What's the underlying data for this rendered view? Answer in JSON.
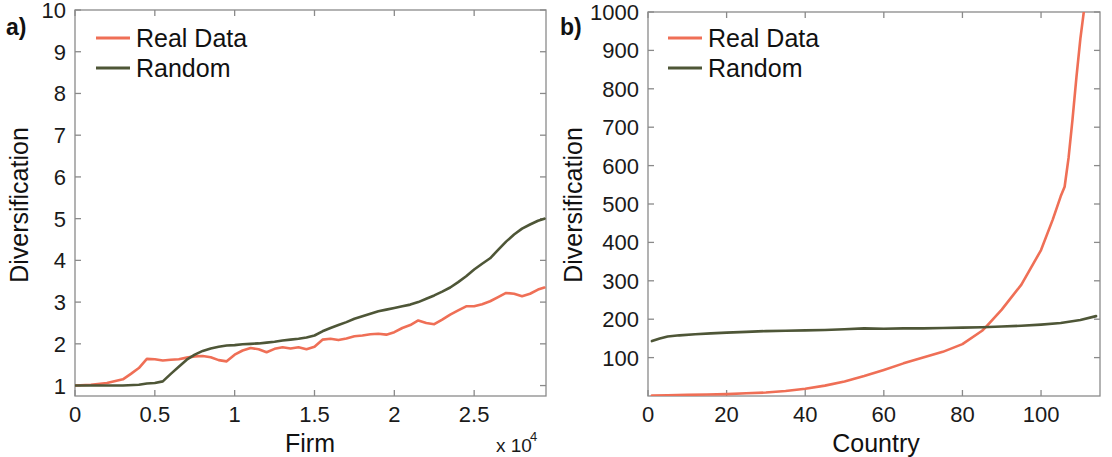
{
  "figure": {
    "background": "#ffffff",
    "colors": {
      "real_data": "#ef6f56",
      "random": "#4e5637",
      "axis": "#8a8a8a",
      "text": "#111111"
    }
  },
  "panels": [
    {
      "tag": "a)",
      "xlabel": "Firm",
      "ylabel": "Diversification",
      "x_exponent_prefix": "x 10",
      "x_exponent_power": "4",
      "legend": [
        {
          "label": "Real Data",
          "color": "#ef6f56"
        },
        {
          "label": "Random",
          "color": "#4e5637"
        }
      ],
      "xticks": [
        "0",
        "0.5",
        "1",
        "1.5",
        "2",
        "2.5"
      ],
      "yticks": [
        "1",
        "2",
        "3",
        "4",
        "5",
        "6",
        "7",
        "8",
        "9",
        "10"
      ]
    },
    {
      "tag": "b)",
      "xlabel": "Country",
      "ylabel": "Diversification",
      "legend": [
        {
          "label": "Real Data",
          "color": "#ef6f56"
        },
        {
          "label": "Random",
          "color": "#4e5637"
        }
      ],
      "xticks": [
        "0",
        "20",
        "40",
        "60",
        "80",
        "100"
      ],
      "yticks": [
        "100",
        "200",
        "300",
        "400",
        "500",
        "600",
        "700",
        "800",
        "900",
        "1000"
      ]
    }
  ],
  "chart_data": [
    {
      "type": "line",
      "panel": "a)",
      "title": "",
      "xlabel": "Firm",
      "ylabel": "Diversification",
      "x_scale_factor": 10000,
      "x_tick_values": [
        0,
        5000,
        10000,
        15000,
        20000,
        25000
      ],
      "y_tick_values": [
        1,
        2,
        3,
        4,
        5,
        6,
        7,
        8,
        9,
        10
      ],
      "xlim": [
        0,
        29500
      ],
      "ylim": [
        0.75,
        10
      ],
      "grid": false,
      "legend_position": "top-left",
      "series": [
        {
          "name": "Real Data",
          "color": "#ef6f56",
          "x": [
            0,
            1000,
            2000,
            3000,
            3500,
            4000,
            4500,
            5000,
            5500,
            6000,
            6500,
            7000,
            7500,
            8000,
            8500,
            9000,
            9500,
            10000,
            10500,
            11000,
            11500,
            12000,
            12500,
            13000,
            13500,
            14000,
            14500,
            15000,
            15500,
            16000,
            16500,
            17000,
            17500,
            18000,
            18500,
            19000,
            19500,
            20000,
            20500,
            21000,
            21500,
            22000,
            22500,
            23000,
            23500,
            24000,
            24500,
            25000,
            25500,
            26000,
            26500,
            27000,
            27500,
            28000,
            28500,
            29000,
            29400
          ],
          "y": [
            1.0,
            1.02,
            1.06,
            1.15,
            1.28,
            1.42,
            1.64,
            1.63,
            1.6,
            1.62,
            1.63,
            1.67,
            1.7,
            1.71,
            1.68,
            1.61,
            1.58,
            1.74,
            1.84,
            1.9,
            1.87,
            1.8,
            1.88,
            1.92,
            1.89,
            1.92,
            1.87,
            1.93,
            2.1,
            2.12,
            2.09,
            2.13,
            2.18,
            2.2,
            2.23,
            2.24,
            2.22,
            2.28,
            2.38,
            2.45,
            2.56,
            2.5,
            2.47,
            2.58,
            2.7,
            2.8,
            2.9,
            2.9,
            2.95,
            3.02,
            3.12,
            3.22,
            3.2,
            3.14,
            3.2,
            3.3,
            3.35
          ]
        },
        {
          "name": "Random",
          "color": "#4e5637",
          "x": [
            0,
            1000,
            2000,
            3000,
            4000,
            4500,
            5000,
            5500,
            6000,
            6500,
            7000,
            7500,
            8000,
            8500,
            9000,
            9500,
            10000,
            10500,
            11000,
            11500,
            12000,
            12500,
            13000,
            13500,
            14000,
            14500,
            15000,
            15500,
            16000,
            16500,
            17000,
            17500,
            18000,
            18500,
            19000,
            19500,
            20000,
            20500,
            21000,
            21500,
            22000,
            22500,
            23000,
            23500,
            24000,
            24500,
            25000,
            25500,
            26000,
            26500,
            27000,
            27500,
            28000,
            28500,
            29000,
            29400
          ],
          "y": [
            1.0,
            1.0,
            1.0,
            1.0,
            1.02,
            1.05,
            1.06,
            1.1,
            1.28,
            1.45,
            1.62,
            1.74,
            1.83,
            1.89,
            1.93,
            1.96,
            1.97,
            1.99,
            2.0,
            2.01,
            2.03,
            2.05,
            2.08,
            2.1,
            2.12,
            2.15,
            2.2,
            2.3,
            2.38,
            2.45,
            2.52,
            2.6,
            2.66,
            2.72,
            2.78,
            2.82,
            2.86,
            2.9,
            2.94,
            3.0,
            3.08,
            3.16,
            3.25,
            3.35,
            3.48,
            3.62,
            3.78,
            3.92,
            4.05,
            4.25,
            4.45,
            4.62,
            4.76,
            4.86,
            4.95,
            5.0
          ]
        }
      ]
    },
    {
      "type": "line",
      "panel": "b)",
      "title": "",
      "xlabel": "Country",
      "ylabel": "Diversification",
      "x_tick_values": [
        0,
        20,
        40,
        60,
        80,
        100
      ],
      "y_tick_values": [
        100,
        200,
        300,
        400,
        500,
        600,
        700,
        800,
        900,
        1000
      ],
      "xlim": [
        0,
        115
      ],
      "ylim": [
        0,
        1000
      ],
      "grid": false,
      "legend_position": "top-left",
      "series": [
        {
          "name": "Real Data",
          "color": "#ef6f56",
          "x": [
            1,
            5,
            10,
            15,
            20,
            25,
            30,
            35,
            40,
            45,
            50,
            55,
            60,
            65,
            70,
            75,
            80,
            85,
            86,
            90,
            95,
            100,
            103,
            105,
            106,
            107,
            108,
            109,
            110,
            111
          ],
          "y": [
            1,
            2,
            3,
            4,
            5,
            7,
            9,
            13,
            19,
            27,
            38,
            52,
            68,
            85,
            100,
            115,
            135,
            170,
            180,
            225,
            290,
            380,
            460,
            520,
            545,
            620,
            720,
            830,
            930,
            1010
          ]
        },
        {
          "name": "Random",
          "color": "#4e5637",
          "x": [
            1,
            3,
            5,
            8,
            12,
            16,
            20,
            25,
            30,
            35,
            40,
            45,
            50,
            55,
            60,
            65,
            70,
            75,
            80,
            85,
            90,
            95,
            100,
            105,
            110,
            114
          ],
          "y": [
            143,
            150,
            155,
            158,
            161,
            163,
            165,
            167,
            169,
            170,
            171,
            172,
            174,
            176,
            175,
            176,
            176,
            177,
            178,
            179,
            181,
            183,
            186,
            190,
            198,
            208
          ]
        }
      ]
    }
  ]
}
